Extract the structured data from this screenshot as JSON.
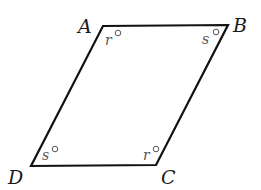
{
  "diagram": {
    "type": "parallelogram",
    "stroke_color": "#111111",
    "vertices": [
      {
        "name": "A",
        "x": 103,
        "y": 26,
        "label_x": 78,
        "label_y": 33
      },
      {
        "name": "B",
        "x": 228,
        "y": 25,
        "label_x": 233,
        "label_y": 32
      },
      {
        "name": "C",
        "x": 156,
        "y": 165,
        "label_x": 161,
        "label_y": 184
      },
      {
        "name": "D",
        "x": 31,
        "y": 166,
        "label_x": 8,
        "label_y": 184
      }
    ],
    "angles": [
      {
        "vertex": "A",
        "label": "r",
        "unit": "°"
      },
      {
        "vertex": "B",
        "label": "s",
        "unit": "°"
      },
      {
        "vertex": "C",
        "label": "r",
        "unit": "°"
      },
      {
        "vertex": "D",
        "label": "s",
        "unit": "°"
      }
    ]
  }
}
